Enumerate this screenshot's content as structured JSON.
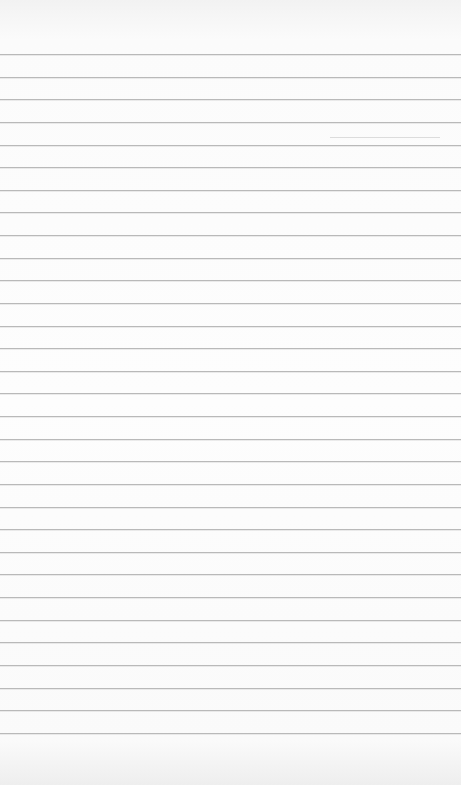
{
  "page": {
    "type": "lined-paper",
    "background_color": "#fdfdfd",
    "line_color": "#b9b9b9",
    "line_count": 31,
    "first_line_y": 54,
    "line_spacing_px": 22.63
  }
}
